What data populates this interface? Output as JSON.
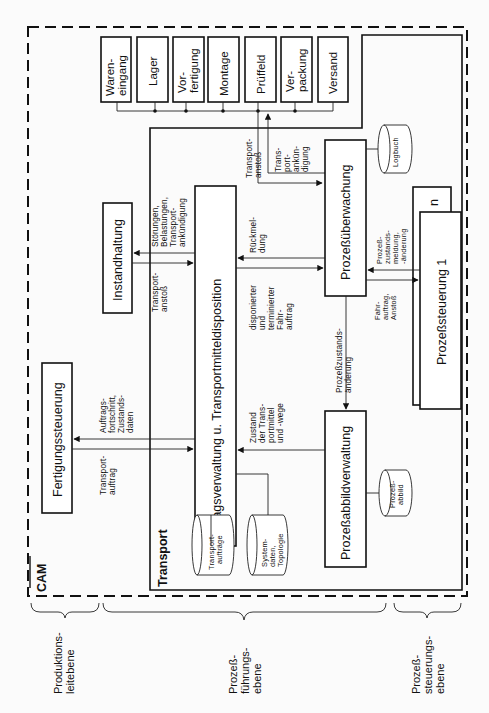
{
  "diagram": {
    "frame_label": "CAM",
    "subsystem_label": "Transport",
    "stations": [
      {
        "line1": "Waren-",
        "line2": "eingang"
      },
      {
        "line1": "Lager",
        "line2": ""
      },
      {
        "line1": "Vor-",
        "line2": "fertigung"
      },
      {
        "line1": "Montage",
        "line2": ""
      },
      {
        "line1": "Prüffeld",
        "line2": ""
      },
      {
        "line1": "Ver-",
        "line2": "packung"
      },
      {
        "line1": "Versand",
        "line2": ""
      }
    ],
    "boxes": {
      "fertigungssteuerung": "Fertigungssteuerung",
      "instandhaltung": "Instandhaltung",
      "auftragsverwaltung": "Auftragsverwaltung u. Transportmitteldisposition",
      "prozessueberwachung": "Prozeßüberwachung",
      "prozessabbildverwaltung": "Prozeßabbildverwaltung",
      "prozesssteuerung_n": "n",
      "prozesssteuerung_1": "Prozeßsteuerung 1"
    },
    "datastores": {
      "logbuch": [
        "Logbuch"
      ],
      "prozessabbild": [
        "Prozeß-",
        "abbild"
      ],
      "transportauftraege": [
        "Transport-",
        "aufträge"
      ],
      "systemdaten": [
        "System-",
        "daten,",
        "Topologie"
      ]
    },
    "flows": {
      "auftragsfortschritt": [
        "Auftrags-",
        "fortschritt,",
        "Zustands-",
        "daten"
      ],
      "transportauftrag": [
        "Transport-",
        "auftrag"
      ],
      "stoerungen": [
        "Störungen,",
        "Belastungen,",
        "Transport-",
        "ankündigung"
      ],
      "transportanstoss_inst": [
        "Transport-",
        "anstoß"
      ],
      "transportanstoss_top": [
        "Transport-",
        "anstoß"
      ],
      "transportankuendigung": [
        "Trans-",
        "port-",
        "ankün-",
        "digung"
      ],
      "rueckmeldung": [
        "Rückmel-",
        "dung"
      ],
      "disponierter": [
        "disponierter",
        "und",
        "terminierter",
        "Fahr-",
        "auftrag"
      ],
      "prozesszustandsaenderung": [
        "Prozeßzustands-",
        "änderung"
      ],
      "zustand_transportmittel": [
        "Zustand",
        "der Trans-",
        "portmittel",
        "und -wege"
      ],
      "prozesszustandsmeldung": [
        "Prozeß-",
        "zustands-",
        "meldung,",
        "-änderung"
      ],
      "fahrauftrag": [
        "Fahr-",
        "auftrag,",
        "Anstoß"
      ]
    },
    "levels": [
      {
        "line1": "Produktions-",
        "line2": "leitebene",
        "line3": ""
      },
      {
        "line1": "Prozeß-",
        "line2": "führungs-",
        "line3": "ebene"
      },
      {
        "line1": "Prozeß-",
        "line2": "steuerungs-",
        "line3": "ebene"
      }
    ]
  }
}
